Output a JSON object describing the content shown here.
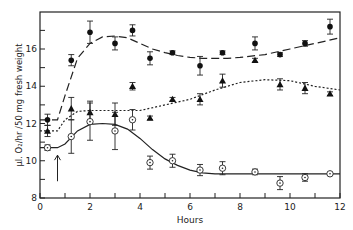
{
  "chart_data": {
    "type": "scatter",
    "title": "",
    "xlabel": "Hours",
    "ylabel": "µl. O₂/hr /50 mg  fresh weight",
    "xlim": [
      0,
      12
    ],
    "ylim": [
      8,
      17.5
    ],
    "xticks_labeled": [
      0,
      2,
      4,
      6,
      8,
      10,
      12
    ],
    "xticks_minor": [
      1,
      3,
      5,
      7,
      9,
      11
    ],
    "yticks_labeled": [
      8,
      10,
      12,
      14,
      16
    ],
    "yticks_minor": [
      9,
      11,
      13,
      15,
      17
    ],
    "grid": false,
    "legend": null,
    "annotations": [
      {
        "type": "arrow",
        "x": 0.7,
        "y_from": 8.9,
        "y_to": 10.3,
        "direction": "up"
      }
    ],
    "series": [
      {
        "name": "filled-circles",
        "marker": "filled-circle",
        "fit_line": "long-dash",
        "x": [
          0.3,
          1.25,
          2.0,
          3.0,
          3.7,
          4.4,
          5.3,
          6.4,
          7.3,
          8.6,
          9.6,
          10.6,
          11.6
        ],
        "y": [
          12.2,
          15.4,
          16.9,
          16.3,
          17.0,
          15.5,
          15.8,
          15.1,
          15.8,
          16.3,
          15.7,
          16.3,
          17.2
        ],
        "err": [
          0.3,
          0.3,
          0.6,
          0.35,
          0.3,
          0.35,
          0.1,
          0.5,
          0.1,
          0.35,
          0.1,
          0.15,
          0.4
        ],
        "fit": [
          [
            0,
            12.2
          ],
          [
            0.7,
            12.2
          ],
          [
            1.0,
            13.5
          ],
          [
            1.5,
            15.5
          ],
          [
            2.0,
            16.3
          ],
          [
            2.5,
            16.65
          ],
          [
            3.0,
            16.7
          ],
          [
            3.5,
            16.6
          ],
          [
            4.0,
            16.3
          ],
          [
            4.5,
            16.0
          ],
          [
            5.0,
            15.8
          ],
          [
            5.5,
            15.65
          ],
          [
            6.0,
            15.55
          ],
          [
            6.5,
            15.5
          ],
          [
            7.0,
            15.5
          ],
          [
            7.5,
            15.5
          ],
          [
            8.0,
            15.55
          ],
          [
            9.0,
            15.7
          ],
          [
            10.0,
            16.0
          ],
          [
            11.0,
            16.3
          ],
          [
            12.0,
            16.6
          ]
        ]
      },
      {
        "name": "filled-triangles",
        "marker": "filled-triangle",
        "fit_line": "short-dash",
        "x": [
          0.3,
          1.25,
          2.0,
          3.0,
          3.7,
          4.4,
          5.3,
          6.4,
          7.3,
          8.6,
          9.6,
          10.6,
          11.6
        ],
        "y": [
          11.6,
          12.8,
          12.6,
          12.5,
          14.0,
          12.3,
          13.3,
          13.3,
          14.3,
          15.4,
          14.1,
          13.9,
          13.6
        ],
        "err": [
          0.3,
          0.6,
          0.6,
          0.6,
          0.2,
          0.1,
          0.1,
          0.3,
          0.35,
          0.1,
          0.3,
          0.3,
          0.1
        ],
        "fit": [
          [
            0,
            11.6
          ],
          [
            0.7,
            11.6
          ],
          [
            1.0,
            12.2
          ],
          [
            1.5,
            12.65
          ],
          [
            2.0,
            12.7
          ],
          [
            3.0,
            12.7
          ],
          [
            4.0,
            12.7
          ],
          [
            5.0,
            13.0
          ],
          [
            6.0,
            13.3
          ],
          [
            7.0,
            13.8
          ],
          [
            8.0,
            14.2
          ],
          [
            9.0,
            14.35
          ],
          [
            10.0,
            14.3
          ],
          [
            11.0,
            14.0
          ],
          [
            12.0,
            13.8
          ]
        ]
      },
      {
        "name": "open-circles",
        "marker": "open-circle-dot",
        "fit_line": "solid",
        "x": [
          0.3,
          1.25,
          2.0,
          3.0,
          3.7,
          4.4,
          5.3,
          6.4,
          7.3,
          8.6,
          9.6,
          10.6,
          11.6
        ],
        "y": [
          10.7,
          11.3,
          12.1,
          11.6,
          12.2,
          9.9,
          10.0,
          9.5,
          9.6,
          9.4,
          8.8,
          9.1,
          9.3
        ],
        "err": [
          0.15,
          0.9,
          1.0,
          1.0,
          0.55,
          0.35,
          0.35,
          0.3,
          0.35,
          0.15,
          0.35,
          0.2,
          0.05
        ],
        "fit": [
          [
            0,
            10.7
          ],
          [
            0.7,
            10.7
          ],
          [
            1.0,
            10.9
          ],
          [
            1.5,
            11.6
          ],
          [
            2.0,
            11.95
          ],
          [
            2.5,
            12.0
          ],
          [
            3.0,
            11.95
          ],
          [
            3.5,
            11.7
          ],
          [
            4.0,
            11.2
          ],
          [
            4.5,
            10.6
          ],
          [
            5.0,
            10.1
          ],
          [
            5.5,
            9.75
          ],
          [
            6.0,
            9.5
          ],
          [
            6.5,
            9.35
          ],
          [
            7.0,
            9.3
          ],
          [
            8.0,
            9.3
          ],
          [
            10.0,
            9.3
          ],
          [
            12.0,
            9.3
          ]
        ]
      }
    ]
  },
  "axes": {
    "xlabel": "Hours",
    "ylabel": "µl. O₂/hr /50 mg  fresh weight"
  }
}
